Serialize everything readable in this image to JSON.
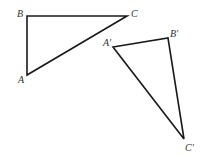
{
  "diagram": {
    "type": "geometry-congruent-triangles",
    "stroke_color": "#1a1a1a",
    "label_color": "#333333",
    "triangles": [
      {
        "name": "ABC",
        "vertices": [
          {
            "label": "A",
            "x": 27,
            "y": 75,
            "label_x": 18,
            "label_y": 83
          },
          {
            "label": "B",
            "x": 27,
            "y": 16,
            "label_x": 17,
            "label_y": 17
          },
          {
            "label": "C",
            "x": 127,
            "y": 16,
            "label_x": 131,
            "label_y": 17
          }
        ]
      },
      {
        "name": "A'B'C'",
        "vertices": [
          {
            "label": "A′",
            "x": 113,
            "y": 47,
            "label_x": 103,
            "label_y": 46
          },
          {
            "label": "B′",
            "x": 168,
            "y": 38,
            "label_x": 170,
            "label_y": 37
          },
          {
            "label": "C′",
            "x": 184,
            "y": 139,
            "label_x": 185,
            "label_y": 151
          }
        ]
      }
    ]
  }
}
